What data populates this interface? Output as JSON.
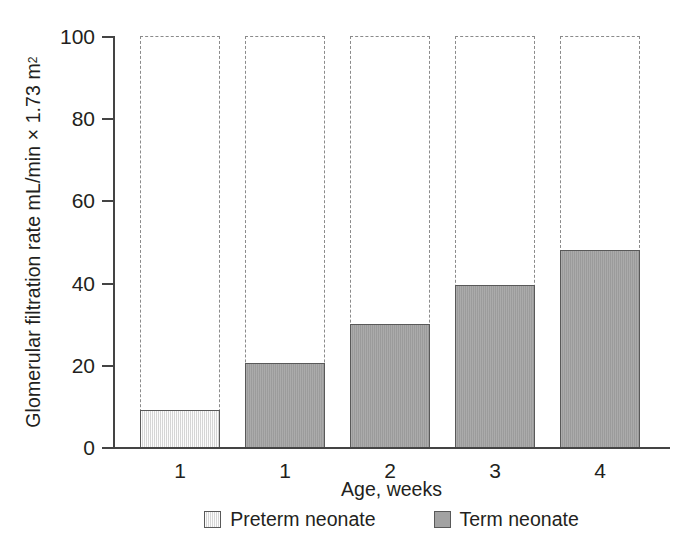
{
  "chart_data": {
    "type": "bar",
    "title": "",
    "categories": [
      "1",
      "1",
      "2",
      "3",
      "4"
    ],
    "values": [
      9,
      20.5,
      30,
      39.5,
      48
    ],
    "series": [
      {
        "name": "Preterm neonate",
        "color": "#e9e9e9",
        "points": [
          {
            "category": "1",
            "value": 9
          }
        ]
      },
      {
        "name": "Term neonate",
        "color": "#a2a2a2",
        "points": [
          {
            "category": "1",
            "value": 20.5
          },
          {
            "category": "2",
            "value": 30
          },
          {
            "category": "3",
            "value": 39.5
          },
          {
            "category": "4",
            "value": 48
          }
        ]
      }
    ],
    "bars": [
      {
        "label": "1",
        "value": 9,
        "group": "Preterm neonate"
      },
      {
        "label": "1",
        "value": 20.5,
        "group": "Term neonate"
      },
      {
        "label": "2",
        "value": 30,
        "group": "Term neonate"
      },
      {
        "label": "3",
        "value": 39.5,
        "group": "Term neonate"
      },
      {
        "label": "4",
        "value": 48,
        "group": "Term neonate"
      }
    ],
    "xlabel": "Age, weeks",
    "ylabel": "Glomerular filtration rate mL/min × 1.73 m",
    "ylabel_superscript": "2",
    "ylim": [
      0,
      100
    ],
    "yticks": [
      "0",
      "20",
      "40",
      "60",
      "80",
      "100"
    ],
    "ytick_values": [
      0,
      20,
      40,
      60,
      80,
      100
    ],
    "grid": false,
    "legend_position": "bottom-center",
    "bar_outline_style": "dashed-to-100"
  },
  "axes": {
    "y": {
      "ticks": [
        {
          "label": "100",
          "value": 100
        },
        {
          "label": "80",
          "value": 80
        },
        {
          "label": "60",
          "value": 60
        },
        {
          "label": "40",
          "value": 40
        },
        {
          "label": "20",
          "value": 20
        },
        {
          "label": "0",
          "value": 0
        }
      ]
    },
    "x": {
      "title": "Age, weeks",
      "ticks": [
        {
          "label": "1"
        },
        {
          "label": "1"
        },
        {
          "label": "2"
        },
        {
          "label": "3"
        },
        {
          "label": "4"
        }
      ]
    }
  },
  "legend": {
    "items": [
      {
        "label": "Preterm neonate",
        "swatch": "preterm"
      },
      {
        "label": "Term neonate",
        "swatch": "term"
      }
    ]
  },
  "colors": {
    "preterm_fill": "#e9e9e9",
    "term_fill": "#a2a2a2",
    "bar_border": "#595959",
    "dashed_outline": "#8b8b8b",
    "axis": "#444444",
    "text": "#231f20",
    "background": "#ffffff"
  }
}
